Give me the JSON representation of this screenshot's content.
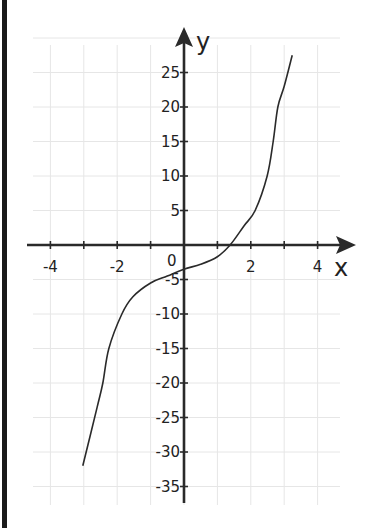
{
  "chart_data": {
    "type": "line",
    "title": "",
    "xlabel": "x",
    "ylabel": "y",
    "xlim": [
      -4.5,
      5
    ],
    "ylim": [
      -37,
      30
    ],
    "grid": true,
    "x_ticks": [
      -4,
      -2,
      2,
      4
    ],
    "x_tick_labels": [
      "-4",
      "-2",
      "2",
      "4"
    ],
    "y_ticks": [
      25,
      20,
      15,
      10,
      5,
      -5,
      -10,
      -15,
      -20,
      -25,
      -30,
      -35
    ],
    "y_tick_labels": [
      "25",
      "20",
      "15",
      "10",
      "5",
      "-5",
      "-10",
      "-15",
      "-20",
      "-25",
      "-30",
      "-35"
    ],
    "origin_label": "0",
    "series": [
      {
        "name": "f(x)",
        "x": [
          -3.03,
          -2.6,
          -2.43,
          -2.25,
          -1.86,
          -1.53,
          -1.0,
          -0.5,
          0,
          0.5,
          1.0,
          1.38,
          1.8,
          2.13,
          2.49,
          2.67,
          2.81,
          3.0,
          3.24
        ],
        "y": [
          -32,
          -23.5,
          -20,
          -15,
          -10,
          -7.5,
          -5.5,
          -4.5,
          -3.5,
          -2.8,
          -1.7,
          0,
          2.8,
          5,
          10,
          15,
          20,
          23,
          27.5
        ]
      }
    ],
    "colors": {
      "curve": "#2a2a2a",
      "axes": "#2a2a2a",
      "grid": "#e6e6e6"
    }
  },
  "labels": {
    "x_axis": "x",
    "y_axis": "y",
    "origin": "0"
  }
}
